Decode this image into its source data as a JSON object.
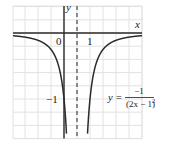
{
  "chart_data": {
    "type": "line",
    "title": "",
    "equation": {
      "lhs": "y =",
      "numerator": "−1",
      "denominator": "(2x − 1)",
      "exponent": "2"
    },
    "xlabel": "x",
    "ylabel": "y",
    "x_tick_labels": [
      {
        "value": 0,
        "label": "0"
      },
      {
        "value": 1,
        "label": "1"
      }
    ],
    "y_tick_labels": [
      {
        "value": -1,
        "label": "−1"
      }
    ],
    "xlim": [
      -1.96,
      3.0
    ],
    "ylim": [
      -1.6,
      0.41
    ],
    "grid": true,
    "grid_step_x": 0.5,
    "grid_step_y": 0.2,
    "vertical_asymptote": {
      "x": 0.5,
      "style": "dashed"
    },
    "horizontal_asymptote": {
      "y": 0
    },
    "series": [
      {
        "name": "y = -1/(2x-1)^2",
        "x": [
          -1.96,
          -1.5,
          -1.0,
          -0.5,
          -0.25,
          0,
          0.1,
          0.0625
        ],
        "y": [
          -0.041,
          -0.0625,
          -0.111,
          -0.25,
          -0.444,
          -1.0,
          -1.5625,
          -1.306
        ]
      },
      {
        "name": "y = -1/(2x-1)^2 (right branch)",
        "x": [
          0.9,
          1.0,
          1.25,
          1.5,
          2.0,
          2.5,
          3.0
        ],
        "y": [
          -1.5625,
          -1.0,
          -0.444,
          -0.25,
          -0.111,
          -0.0625,
          -0.04
        ]
      }
    ],
    "colors": {
      "curve": "#2a2a2a",
      "axis": "#2a2a2a",
      "grid": "#e2e2e2",
      "asymptote": "#555555"
    }
  }
}
